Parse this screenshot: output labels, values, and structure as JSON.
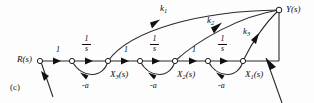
{
  "figure": {
    "panel_id": "(c)",
    "type": "signal-flow-graph",
    "caption_present": false
  },
  "nodes": [
    {
      "id": "r",
      "label": "R(s)",
      "label_sub": "",
      "x": 40,
      "y": 61,
      "label_x": 17,
      "label_y": 56
    },
    {
      "id": "n1",
      "label": "",
      "label_sub": "",
      "x": 72,
      "y": 61,
      "label_x": 0,
      "label_y": 0
    },
    {
      "id": "x3",
      "label": "X",
      "label_sub": "3",
      "label_tail": "(s)",
      "x": 108,
      "y": 61,
      "label_x": 110,
      "label_y": 71
    },
    {
      "id": "n2",
      "label": "",
      "label_sub": "",
      "x": 140,
      "y": 61,
      "label_x": 0,
      "label_y": 0
    },
    {
      "id": "x2",
      "label": "X",
      "label_sub": "2",
      "label_tail": "(s)",
      "x": 175,
      "y": 61,
      "label_x": 177,
      "label_y": 71
    },
    {
      "id": "n3",
      "label": "",
      "label_sub": "",
      "x": 208,
      "y": 61,
      "label_x": 0,
      "label_y": 0
    },
    {
      "id": "x1",
      "label": "X",
      "label_sub": "1",
      "label_tail": "(s)",
      "x": 243,
      "y": 61,
      "label_x": 245,
      "label_y": 71
    },
    {
      "id": "y",
      "label": "Y(s)",
      "label_sub": "",
      "x": 279,
      "y": 10,
      "label_x": 286,
      "label_y": 6
    }
  ],
  "forward_gains": [
    {
      "id": "g1",
      "text": "1",
      "kind": "plain",
      "x": 56,
      "y": 47
    },
    {
      "id": "g2",
      "num": "1",
      "den": "s",
      "kind": "fraction",
      "x": 86,
      "y": 37
    },
    {
      "id": "g3",
      "text": "1",
      "kind": "plain",
      "x": 124,
      "y": 47
    },
    {
      "id": "g4",
      "num": "1",
      "den": "s",
      "kind": "fraction",
      "x": 153,
      "y": 37
    },
    {
      "id": "g5",
      "text": "1",
      "kind": "plain",
      "x": 192,
      "y": 47
    },
    {
      "id": "g6",
      "num": "1",
      "den": "s",
      "kind": "fraction",
      "x": 221,
      "y": 37
    }
  ],
  "feedback_gains": [
    {
      "id": "fb1",
      "text": "-a",
      "x": 85,
      "y": 83
    },
    {
      "id": "fb2",
      "text": "-a",
      "x": 153,
      "y": 83
    },
    {
      "id": "fb3",
      "text": "-a",
      "x": 221,
      "y": 83
    }
  ],
  "output_gains": [
    {
      "id": "k1",
      "label": "k",
      "sub": "1",
      "x": 160,
      "y": 5
    },
    {
      "id": "k2",
      "label": "k",
      "sub": "2",
      "x": 207,
      "y": 17
    },
    {
      "id": "k3",
      "label": "k",
      "sub": "3",
      "x": 243,
      "y": 28
    }
  ],
  "style": {
    "line_color": "#2a2a2a",
    "node_fill": "#ffffff",
    "node_stroke": "#1a1a1a",
    "arrow_fill": "#101010",
    "background": "#fdfdfd",
    "line_width": 1.1
  }
}
